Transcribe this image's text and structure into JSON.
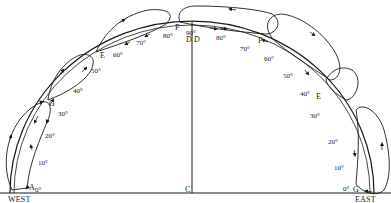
{
  "diagram": {
    "type": "semicircular arc with looping flow paths",
    "directions": {
      "west": "WEST",
      "east": "EAST"
    },
    "center_label": "C",
    "top_labels": [
      "D",
      "D"
    ],
    "west_points": [
      "A",
      "G",
      "E",
      "F"
    ],
    "east_points": [
      "F",
      "E",
      "G"
    ],
    "west_degrees": [
      "0°",
      "10°",
      "20°",
      "30°",
      "40°",
      "50°",
      "60°",
      "70°",
      "80°",
      "90°"
    ],
    "east_degrees": [
      "90°",
      "80°",
      "70°",
      "60°",
      "50°",
      "40°",
      "30°",
      "20°",
      "10°",
      "0°"
    ],
    "line_color": "#1a1a1a"
  }
}
